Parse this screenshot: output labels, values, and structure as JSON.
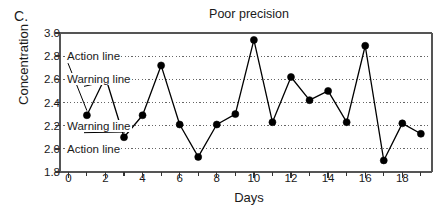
{
  "panel": {
    "letter": "C."
  },
  "chart_data": {
    "type": "line",
    "title": "Poor precision",
    "xlabel": "Days",
    "ylabel": "Concentration",
    "x": [
      1,
      2,
      3,
      4,
      5,
      6,
      7,
      8,
      9,
      10,
      11,
      12,
      13,
      14,
      15,
      16,
      17,
      18,
      19
    ],
    "values": [
      2.29,
      2.62,
      2.1,
      2.29,
      2.72,
      2.21,
      1.93,
      2.21,
      2.3,
      2.94,
      2.23,
      2.62,
      2.42,
      2.5,
      2.23,
      2.89,
      1.9,
      2.22,
      2.13
    ],
    "series": [
      {
        "name": "Concentration",
        "values": [
          2.29,
          2.62,
          2.1,
          2.29,
          2.72,
          2.21,
          1.93,
          2.21,
          2.3,
          2.94,
          2.23,
          2.62,
          2.42,
          2.5,
          2.23,
          2.89,
          1.9,
          2.22,
          2.13
        ]
      }
    ],
    "xlim": [
      -0.45,
      19.6
    ],
    "ylim": [
      1.8,
      3.0
    ],
    "ytick_labels": [
      "3.0",
      "2.8",
      "2.6",
      "2.4",
      "2.2",
      "2.0",
      "1.8"
    ],
    "ytick_values": [
      3.0,
      2.8,
      2.6,
      2.4,
      2.2,
      2.0,
      1.8
    ],
    "xtick_labels": [
      "0",
      "2",
      "4",
      "6",
      "8",
      "10",
      "12",
      "14",
      "16",
      "18"
    ],
    "xtick_values": [
      0,
      2,
      4,
      6,
      8,
      10,
      12,
      14,
      16,
      18
    ],
    "xminor_values": [
      1,
      3,
      5,
      7,
      9,
      11,
      13,
      15,
      17,
      19
    ],
    "grid": "horizontal-dotted",
    "gridlines": [
      2.8,
      2.6,
      2.2,
      2.0
    ],
    "gridline_midline": 2.4,
    "legend": "none",
    "marker": "filled-circle",
    "line_color": "#000000",
    "marker_color": "#000000",
    "grid_color": "#666666",
    "annotations": [
      {
        "label": "Action line",
        "value": 2.8,
        "text_y": 2.8,
        "leader_to_x": 1.0,
        "leader_to_y": 2.33
      },
      {
        "label": "Warning line",
        "value": 2.6,
        "text_y": 2.6,
        "leader_to_x": 2.0,
        "leader_to_y": 2.58
      },
      {
        "label": "Warning line",
        "value": 2.2,
        "text_y": 2.2,
        "leader_to_x": 3.05,
        "leader_to_y": 2.145
      },
      {
        "label": "Action line",
        "value": 2.0,
        "text_y": 2.0,
        "leader_to_x": null,
        "leader_to_y": null
      }
    ]
  }
}
